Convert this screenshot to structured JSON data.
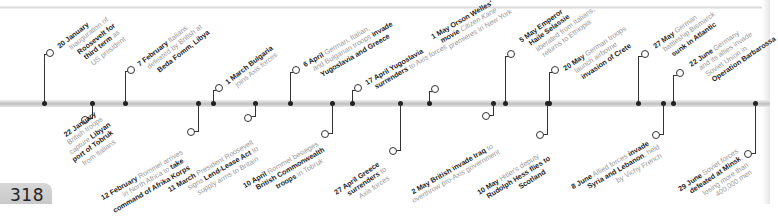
{
  "page_number": "318",
  "timeline": {
    "events_above": [
      {
        "id": "jan20",
        "date": "20 January",
        "lines": [
          [
            "20 January",
            ""
          ],
          [
            "",
            "Inauguration of"
          ],
          [
            "Roosevelt for",
            ""
          ],
          [
            "third term",
            " as"
          ],
          [
            "",
            "US president"
          ]
        ]
      },
      {
        "id": "feb7",
        "date": "7 February",
        "lines": [
          [
            "7 February",
            " Italians"
          ],
          [
            "",
            "defeated by British at"
          ],
          [
            "Beda Fomm, Libya",
            ""
          ]
        ]
      },
      {
        "id": "mar1",
        "date": "1 March",
        "lines": [
          [
            "1 March Bulgaria",
            ""
          ],
          [
            "",
            "joins Axis forces"
          ]
        ]
      },
      {
        "id": "apr6",
        "date": "6 April",
        "lines": [
          [
            "6 April",
            " German, Italian,"
          ],
          [
            "",
            "and Bulgarian troops ",
            [
              "invade"
            ]
          ],
          [
            "Yugoslavia and Greece",
            ""
          ]
        ]
      },
      {
        "id": "apr17",
        "date": "17 April",
        "lines": [
          [
            "17 April Yugoslavia",
            ""
          ],
          [
            "surrenders",
            " to Axis forces"
          ]
        ]
      },
      {
        "id": "may1",
        "date": "1 May",
        "lines": [
          [
            "1 May Orson Welles'",
            ""
          ],
          [
            "movie",
            " Citizen Kane"
          ],
          [
            "",
            "premieres in New York"
          ]
        ]
      },
      {
        "id": "may5",
        "date": "5 May",
        "lines": [
          [
            "5 May Emperor",
            ""
          ],
          [
            "Haile Selassie",
            ""
          ],
          [
            "",
            "liberated from Italians,"
          ],
          [
            "",
            "returns to Ethiopia"
          ]
        ]
      },
      {
        "id": "may20",
        "date": "20 May",
        "lines": [
          [
            "20 May",
            " German troops"
          ],
          [
            "",
            "launch airborne"
          ],
          [
            "invasion of Crete",
            ""
          ]
        ]
      },
      {
        "id": "may27",
        "date": "27 May",
        "lines": [
          [
            "27 May",
            " German"
          ],
          [
            "",
            "battleship Bismarck"
          ],
          [
            "sunk in Atlantic",
            ""
          ]
        ]
      },
      {
        "id": "jun22",
        "date": "22 June",
        "lines": [
          [
            "22 June",
            " Germany"
          ],
          [
            "",
            "and its allies invade"
          ],
          [
            "",
            "Soviet Union in"
          ],
          [
            "Operation Barbarossa",
            ""
          ]
        ]
      }
    ],
    "events_below": [
      {
        "id": "jan22",
        "date": "22 January",
        "lines": [
          [
            "22 January",
            ""
          ],
          [
            "",
            "British troops"
          ],
          [
            "",
            "capture ",
            [
              "Libyan"
            ]
          ],
          [
            "port of Tobruk",
            ""
          ],
          [
            "",
            "from Italians"
          ]
        ]
      },
      {
        "id": "feb12",
        "date": "12 February",
        "lines": [
          [
            "12 February",
            " Rommel arrives"
          ],
          [
            "",
            "in North Africa to ",
            [
              "take"
            ]
          ],
          [
            "command of Afrika Korps",
            ""
          ]
        ]
      },
      {
        "id": "mar11",
        "date": "11 March",
        "lines": [
          [
            "11 March",
            " President Roosevelt"
          ],
          [
            "",
            "signs ",
            [
              "Lend-Lease Act"
            ],
            " to"
          ],
          [
            "",
            "supply arms to Britain"
          ]
        ]
      },
      {
        "id": "apr10",
        "date": "10 April",
        "lines": [
          [
            "10 April",
            " Rommel besieges"
          ],
          [
            "British Commonwealth",
            ""
          ],
          [
            "troops",
            " in Tobruk"
          ]
        ]
      },
      {
        "id": "apr27",
        "date": "27 April",
        "lines": [
          [
            "27 April Greece",
            ""
          ],
          [
            "surrenders",
            " to"
          ],
          [
            "",
            "Axis forces"
          ]
        ]
      },
      {
        "id": "may2",
        "date": "2 May",
        "lines": [
          [
            "2 May British invade Iraq",
            " to"
          ],
          [
            "",
            "overthrow pro-Axis government"
          ]
        ]
      },
      {
        "id": "may10",
        "date": "10 May",
        "lines": [
          [
            "10 May",
            " Hitler's deputy"
          ],
          [
            "Rudolph Hess flies to",
            ""
          ],
          [
            "Scotland",
            ""
          ]
        ]
      },
      {
        "id": "jun8",
        "date": "8 June",
        "lines": [
          [
            "8 June",
            " Allied forces ",
            [
              "invade"
            ]
          ],
          [
            "Syria and Lebanon",
            ", held"
          ],
          [
            "",
            "by Vichy French"
          ]
        ]
      },
      {
        "id": "jun29",
        "date": "29 June",
        "lines": [
          [
            "29 June",
            " Soviet forces"
          ],
          [
            "defeated at Minsk",
            ","
          ],
          [
            "",
            "losing more than"
          ],
          [
            "",
            "400,000 men"
          ]
        ]
      }
    ]
  },
  "text": {
    "jan20": [
      "20 January",
      "Inauguration of",
      "Roosevelt for",
      "third term",
      "as",
      "US president"
    ],
    "feb7": [
      "7 February",
      "Italians",
      "defeated by British at",
      "Beda Fomm, Libya"
    ],
    "mar1": [
      "1 March Bulgaria",
      "joins Axis forces"
    ],
    "apr6": [
      "6 April",
      "German, Italian,",
      "and Bulgarian troops",
      "invade",
      "Yugoslavia and Greece"
    ],
    "apr17": [
      "17 April Yugoslavia",
      "surrenders",
      "to Axis forces"
    ],
    "may1": [
      "1 May Orson Welles'",
      "movie",
      "Citizen Kane",
      "premieres in New York"
    ],
    "may5": [
      "5 May Emperor",
      "Haile Selassie",
      "liberated from Italians,",
      "returns to Ethiopia"
    ],
    "may20": [
      "20 May",
      "German troops",
      "launch airborne",
      "invasion of Crete"
    ],
    "may27": [
      "27 May",
      "German",
      "battleship Bismarck",
      "sunk in Atlantic"
    ],
    "jun22": [
      "22 June",
      "Germany",
      "and its allies invade",
      "Soviet Union in",
      "Operation Barbarossa"
    ],
    "jan22": [
      "22 January",
      "British troops",
      "capture",
      "Libyan",
      "port of Tobruk",
      "from Italians"
    ],
    "feb12": [
      "12 February",
      "Rommel arrives",
      "in North Africa to",
      "take",
      "command of Afrika Korps"
    ],
    "mar11": [
      "11 March",
      "President Roosevelt",
      "signs",
      "Lend-Lease Act",
      "to",
      "supply arms to Britain"
    ],
    "apr10": [
      "10 April",
      "Rommel besieges",
      "British Commonwealth",
      "troops",
      "in Tobruk"
    ],
    "apr27": [
      "27 April Greece",
      "surrenders",
      "to",
      "Axis forces"
    ],
    "may2": [
      "2 May British invade Iraq",
      "to",
      "overthrow pro-Axis government"
    ],
    "may10": [
      "10 May",
      "Hitler's deputy",
      "Rudolph Hess flies to",
      "Scotland"
    ],
    "jun8": [
      "8 June",
      "Allied forces",
      "invade",
      "Syria and Lebanon",
      ", held",
      "by Vichy French"
    ],
    "jun29": [
      "29 June",
      "Soviet forces",
      "defeated at Minsk",
      ",",
      "losing more than",
      "400,000 men"
    ]
  },
  "colors": {
    "bold_text": "#1e1e1e",
    "light_text": "#9a9a9a",
    "axis": "#c4c4c4",
    "stem": "#333333"
  }
}
